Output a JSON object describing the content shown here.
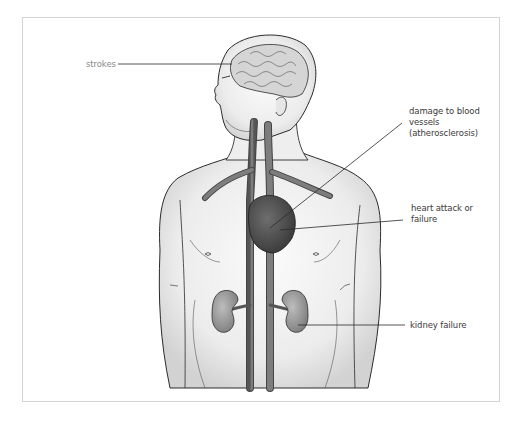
{
  "figure": {
    "labels": {
      "strokes": "strokes",
      "damage_line1": "damage to blood",
      "damage_line2": "vessels",
      "damage_line3": "(atherosclerosis)",
      "heart_line1": "heart attack or",
      "heart_line2": "failure",
      "kidney": "kidney failure"
    },
    "colors": {
      "outline": "#2b2b2b",
      "skin": "#ececec",
      "vessel": "#6f6f6f",
      "heart": "#4a4a4a",
      "kidney": "#8a8a8a",
      "brain": "#cfcfcf",
      "frame_border": "#d4d4d4",
      "label_text": "#3a3a3a",
      "leader_line": "#2a2a2a"
    }
  }
}
